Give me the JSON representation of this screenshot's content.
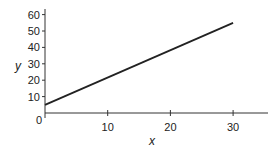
{
  "chart_data": {
    "type": "line",
    "title": "",
    "xlabel": "x",
    "ylabel": "y",
    "x_ticks": [
      10,
      20,
      30
    ],
    "y_ticks": [
      10,
      20,
      30,
      40,
      50,
      60
    ],
    "origin_label": "0",
    "xlim": [
      0,
      35
    ],
    "ylim": [
      0,
      65
    ],
    "grid": false,
    "legend": null,
    "series": [
      {
        "name": "y",
        "x": [
          0,
          30
        ],
        "values": [
          5,
          55
        ],
        "color": "#222222"
      }
    ]
  }
}
